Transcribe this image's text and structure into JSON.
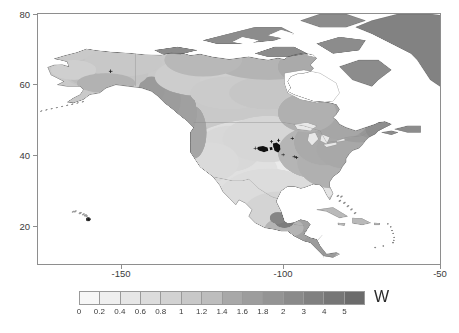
{
  "figure": {
    "background": "#ffffff",
    "frame_color": "#8e8e8e",
    "text_color": "#3b3b3b"
  },
  "axes": {
    "x": {
      "label": "",
      "ticks": [
        {
          "value": -150,
          "label": "-150",
          "px": 121
        },
        {
          "value": -100,
          "label": "-100",
          "px": 283
        },
        {
          "value": -50,
          "label": "-50",
          "px": 440
        }
      ],
      "range": [
        -171,
        -47
      ]
    },
    "y": {
      "label": "",
      "ticks": [
        {
          "value": 80,
          "label": "80",
          "px": 14
        },
        {
          "value": 60,
          "label": "60",
          "px": 84
        },
        {
          "value": 40,
          "label": "40",
          "px": 155
        },
        {
          "value": 20,
          "label": "20",
          "px": 226
        }
      ],
      "range": [
        6,
        82
      ]
    }
  },
  "colorbar": {
    "unit_label": "W",
    "orientation": "horizontal",
    "boundaries": [
      0,
      0.2,
      0.4,
      0.6,
      0.8,
      1,
      1.2,
      1.4,
      1.6,
      1.8,
      2,
      3,
      4,
      5,
      6
    ],
    "tick_labels": [
      "0",
      "0.2",
      "0.4",
      "0.6",
      "0.8",
      "1",
      "1.2",
      "1.4",
      "1.6",
      "1.8",
      "2",
      "3",
      "4",
      "5"
    ],
    "segment_colors": [
      "#f7f7f7",
      "#efefef",
      "#e6e6e6",
      "#dcdcdc",
      "#d2d2d2",
      "#c8c8c8",
      "#bdbdbd",
      "#a8a8a8",
      "#9d9d9d",
      "#949494",
      "#8a8a8a",
      "#808080",
      "#767676",
      "#6b6b6b"
    ]
  },
  "chart_data": {
    "type": "heatmap",
    "title": "",
    "subtitle": "",
    "xlabel": "",
    "ylabel": "",
    "xlim": [
      -171,
      -47
    ],
    "ylim": [
      6,
      82
    ],
    "grid": false,
    "legend_position": "bottom",
    "colorbar_unit": "W",
    "colorbar_levels": [
      0,
      0.2,
      0.4,
      0.6,
      0.8,
      1,
      1.2,
      1.4,
      1.6,
      1.8,
      2,
      3,
      4,
      5
    ],
    "xticks": [
      -150,
      -100,
      -50
    ],
    "yticks": [
      20,
      40,
      60,
      80
    ],
    "region": "North America",
    "annotations": [
      {
        "name": "marker-alaska",
        "lon": -148.5,
        "lat": 64.5,
        "symbol": "+"
      },
      {
        "name": "marker-hawaii",
        "lon": -155.5,
        "lat": 19.5,
        "symbol": "+"
      },
      {
        "name": "marker-cluster-central-plains",
        "lon": -101.5,
        "lat": 41.0,
        "symbol": "+"
      },
      {
        "name": "marker-cluster-midwest",
        "lon": -97.0,
        "lat": 41.5,
        "symbol": "+"
      },
      {
        "name": "marker-upper-midwest",
        "lon": -92.5,
        "lat": 44.0,
        "symbol": "+"
      },
      {
        "name": "marker-pair-missouri",
        "lon": -92.0,
        "lat": 38.5,
        "symbol": "+"
      }
    ],
    "shading_description": "Grayscale filled contours of W over land; light values over central/southern US and Mexico, darker values over eastern Canada, Greenland and the Arctic archipelago; oceans unfilled white."
  }
}
